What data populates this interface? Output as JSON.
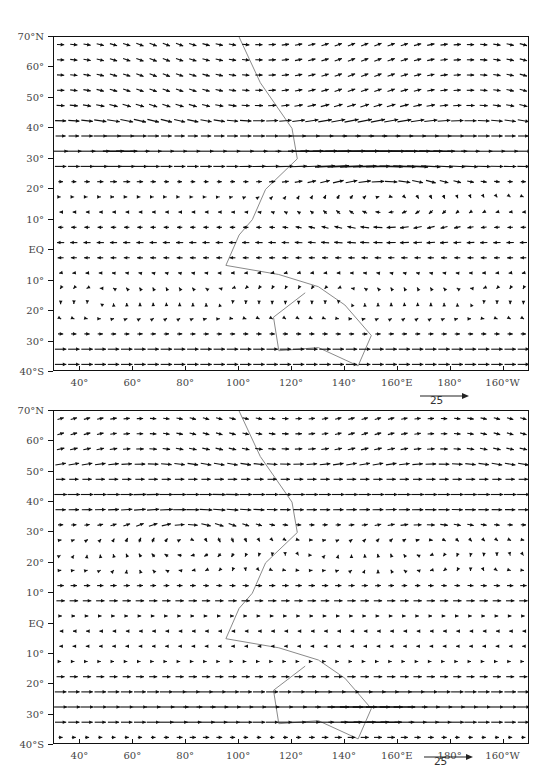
{
  "chart_data": [
    {
      "type": "vector_field",
      "panel": "upper",
      "title": "",
      "xlabel": "",
      "ylabel": "",
      "x_ticks": [
        "40°",
        "60°",
        "80°",
        "100°",
        "120°",
        "140°",
        "160°E",
        "180°",
        "160°W"
      ],
      "x_tick_lon": [
        40,
        60,
        80,
        100,
        120,
        140,
        160,
        180,
        200
      ],
      "y_ticks": [
        "70°N",
        "60°",
        "50°",
        "40°",
        "30°",
        "20°",
        "10°",
        "EQ",
        "10°",
        "20°",
        "30°",
        "40°S"
      ],
      "y_tick_lat": [
        70,
        60,
        50,
        40,
        30,
        20,
        10,
        0,
        -10,
        -20,
        -30,
        -40
      ],
      "xlim": [
        30,
        210
      ],
      "ylim": [
        -40,
        70
      ],
      "reference_vector": {
        "label": "25",
        "units": "m/s"
      },
      "features": [
        {
          "name": "westerly jet core",
          "lat": 32,
          "lon_range": [
            40,
            210
          ],
          "peak_lon": 150,
          "speed": 30,
          "direction": "eastward"
        },
        {
          "name": "subtropical anticyclone (western Pacific)",
          "center_lat": 18,
          "center_lon": 155,
          "rotation": "clockwise"
        },
        {
          "name": "tropical easterlies",
          "lat_range": [
            -10,
            15
          ],
          "direction": "westward"
        },
        {
          "name": "southern westerlies",
          "lat_range": [
            -40,
            -25
          ],
          "direction": "eastward"
        }
      ]
    },
    {
      "type": "vector_field",
      "panel": "lower",
      "title": "",
      "xlabel": "",
      "ylabel": "",
      "x_ticks": [
        "40°",
        "60°",
        "80°",
        "100°",
        "120°",
        "140°",
        "160°E",
        "180°",
        "160°W"
      ],
      "x_tick_lon": [
        40,
        60,
        80,
        100,
        120,
        140,
        160,
        180,
        200
      ],
      "y_ticks": [
        "70°N",
        "60°",
        "50°",
        "40°",
        "30°",
        "20°",
        "10°",
        "EQ",
        "10°",
        "20°",
        "30°",
        "40°S"
      ],
      "y_tick_lat": [
        70,
        60,
        50,
        40,
        30,
        20,
        10,
        0,
        -10,
        -20,
        -30,
        -40
      ],
      "xlim": [
        30,
        210
      ],
      "ylim": [
        -40,
        70
      ],
      "reference_vector": {
        "label": "25",
        "units": "m/s"
      },
      "features": [
        {
          "name": "northern westerly belt",
          "lat": 42,
          "lon_range": [
            30,
            210
          ],
          "speed": 20,
          "direction": "eastward"
        },
        {
          "name": "Asian anticyclone",
          "center_lat": 28,
          "center_lon": 80,
          "rotation": "clockwise"
        },
        {
          "name": "tropical westerlies",
          "lat_range": [
            5,
            15
          ],
          "direction": "eastward"
        },
        {
          "name": "southern westerly jet",
          "lat": -30,
          "peak_lon": 150,
          "speed": 30,
          "direction": "eastward"
        }
      ]
    }
  ],
  "panels": [
    {
      "id": "upper",
      "ref_label": "25"
    },
    {
      "id": "lower",
      "ref_label": "25"
    }
  ],
  "colors": {
    "vectors": "#111111",
    "coast": "#8a8a8a",
    "frame": "#111111",
    "labels": "#444444"
  }
}
